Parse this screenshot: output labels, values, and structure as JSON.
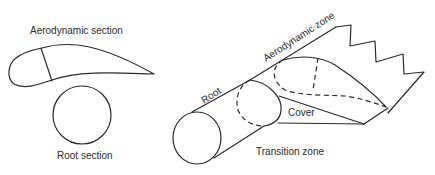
{
  "diagram": {
    "type": "wind-turbine-blade-schematic",
    "line_color": "#2a2a2a",
    "background": "#ffffff",
    "labels": {
      "aerodynamic_section": "Aerodynamic section",
      "root_section": "Root section",
      "root": "Root",
      "aerodynamic_zone": "Aerodynamic zone",
      "cover": "Cover",
      "transition_zone": "Transition zone"
    }
  }
}
